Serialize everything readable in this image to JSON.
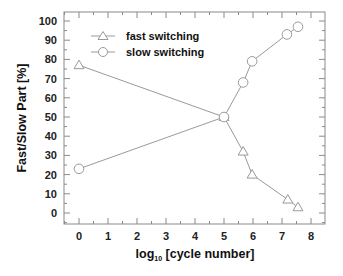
{
  "chart_data": {
    "type": "line",
    "title": "",
    "xlabel": "log10 [cycle number]",
    "xlabel_main": "log",
    "xlabel_sub": "10",
    "xlabel_rest": " [cycle number]",
    "ylabel": "Fast/Slow Part [%]",
    "xlim": [
      -0.5,
      8.5
    ],
    "ylim": [
      -5,
      105
    ],
    "xticks": [
      0,
      1,
      2,
      3,
      4,
      5,
      6,
      7,
      8
    ],
    "yticks": [
      0,
      10,
      20,
      30,
      40,
      50,
      60,
      70,
      80,
      90,
      100
    ],
    "grid": false,
    "legend_position": "upper left",
    "series": [
      {
        "name": "fast switching",
        "marker": "triangle",
        "color": "#9a9a9a",
        "x": [
          0,
          5,
          5.66,
          5.97,
          7.2,
          7.55
        ],
        "y": [
          77,
          50,
          32,
          20,
          7,
          3
        ]
      },
      {
        "name": "slow switching",
        "marker": "circle",
        "color": "#9a9a9a",
        "x": [
          0,
          5,
          5.66,
          5.97,
          7.17,
          7.55
        ],
        "y": [
          23,
          50,
          68,
          79,
          93,
          97
        ]
      }
    ]
  },
  "legend": {
    "fast": "fast switching",
    "slow": "slow switching"
  },
  "axes": {
    "ylabel": "Fast/Slow Part [%]",
    "xlabel_main": "log",
    "xlabel_sub": "10",
    "xlabel_rest": " [cycle number]"
  }
}
